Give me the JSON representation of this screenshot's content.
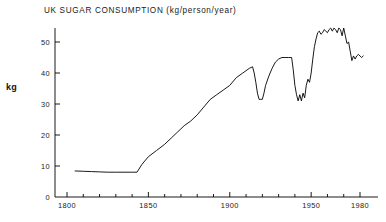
{
  "chart": {
    "title": "UK SUGAR CONSUMPTION  (kg/person/year)",
    "y_axis_label": "kg"
  },
  "chart_data": {
    "type": "line",
    "title": "UK SUGAR CONSUMPTION  (kg/person/year)",
    "xlabel": "",
    "ylabel": "kg",
    "xlim": [
      1795,
      1984
    ],
    "ylim": [
      0,
      56
    ],
    "grid": false,
    "legend": null,
    "line_color": "#000000",
    "xticks": [
      1800,
      1850,
      1900,
      1950,
      1980
    ],
    "xtick_labels": [
      "1800",
      "1850",
      "1900",
      "1950",
      "1980"
    ],
    "x_minor_tick_step": 10,
    "yticks": [
      0,
      10,
      20,
      30,
      40,
      50
    ],
    "ytick_labels": [
      "0",
      "10",
      "20",
      "30",
      "40",
      "50"
    ],
    "series": [
      {
        "name": "UK sugar consumption",
        "x": [
          1805,
          1810,
          1815,
          1820,
          1825,
          1830,
          1835,
          1840,
          1843,
          1846,
          1850,
          1855,
          1860,
          1864,
          1868,
          1872,
          1876,
          1880,
          1884,
          1888,
          1892,
          1896,
          1900,
          1904,
          1908,
          1912,
          1914,
          1915,
          1916,
          1917,
          1918,
          1919,
          1920,
          1921,
          1922,
          1924,
          1926,
          1928,
          1930,
          1932,
          1934,
          1936,
          1938,
          1939,
          1940,
          1941,
          1942,
          1943,
          1944,
          1945,
          1946,
          1947,
          1948,
          1949,
          1950,
          1951,
          1952,
          1953,
          1954,
          1955,
          1956,
          1957,
          1958,
          1959,
          1960,
          1961,
          1962,
          1963,
          1964,
          1965,
          1966,
          1967,
          1968,
          1969,
          1970,
          1971,
          1972,
          1973,
          1974,
          1975,
          1976,
          1977,
          1978,
          1979,
          1980,
          1981,
          1982
        ],
        "y": [
          8.4,
          8.3,
          8.2,
          8.1,
          8.0,
          8.0,
          8.0,
          8.0,
          8.0,
          10.5,
          13.0,
          15.0,
          17.0,
          19.0,
          21.0,
          23.0,
          24.5,
          26.5,
          29.0,
          31.5,
          33.0,
          34.5,
          36.0,
          38.5,
          40.0,
          41.5,
          42.0,
          40.0,
          37.0,
          33.5,
          31.5,
          31.5,
          31.5,
          33.5,
          36.0,
          39.0,
          41.5,
          43.5,
          44.5,
          45.0,
          45.0,
          45.0,
          45.0,
          41.0,
          36.0,
          33.0,
          31.0,
          33.0,
          31.0,
          33.5,
          32.0,
          36.0,
          38.0,
          37.0,
          40.0,
          44.5,
          48.5,
          51.0,
          53.0,
          53.5,
          52.5,
          53.0,
          54.0,
          53.5,
          53.0,
          54.0,
          54.5,
          53.5,
          54.5,
          54.0,
          53.0,
          54.5,
          54.0,
          52.0,
          54.5,
          52.0,
          49.5,
          50.0,
          47.0,
          44.0,
          45.5,
          44.5,
          45.5,
          46.0,
          45.5,
          45.0,
          45.5
        ]
      }
    ]
  }
}
